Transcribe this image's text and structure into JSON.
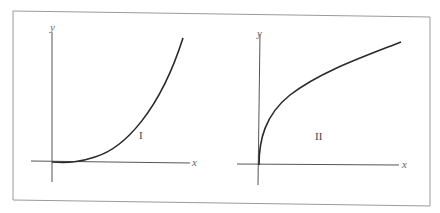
{
  "figure": {
    "frame_color": "#9a9a9a",
    "curve_color": "#2a2a2a",
    "axis_color": "#555555"
  },
  "graphs": [
    {
      "id": "I",
      "label": "I",
      "x_axis_label": "x",
      "y_axis_label": "y",
      "shape": "concave-up increasing curve starting flat at origin"
    },
    {
      "id": "II",
      "label": "II",
      "x_axis_label": "x",
      "y_axis_label": "y",
      "shape": "concave-down increasing curve starting vertical at origin"
    }
  ]
}
